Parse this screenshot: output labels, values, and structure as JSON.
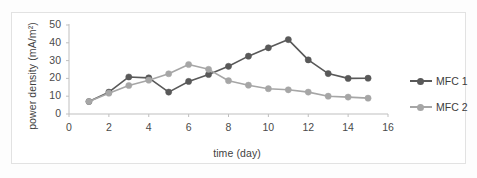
{
  "chart_data": {
    "type": "line",
    "title": "",
    "xlabel": "time (day)",
    "ylabel": "power density (mA/m²)",
    "x": [
      1,
      2,
      3,
      4,
      5,
      6,
      7,
      8,
      9,
      10,
      11,
      12,
      13,
      14,
      15
    ],
    "xlim": [
      0,
      16
    ],
    "ylim": [
      0,
      50
    ],
    "xticks": [
      "0",
      "2",
      "4",
      "6",
      "8",
      "10",
      "12",
      "14",
      "16"
    ],
    "xtick_values": [
      0,
      2,
      4,
      6,
      8,
      10,
      12,
      14,
      16
    ],
    "yticks": [
      "0",
      "10",
      "20",
      "30",
      "40",
      "50"
    ],
    "ytick_values": [
      0,
      10,
      20,
      30,
      40,
      50
    ],
    "grid": false,
    "legend_position": "right",
    "series": [
      {
        "name": "MFC 1",
        "color": "#595959",
        "marker": "circle",
        "values": [
          7.0,
          12.3,
          20.8,
          20.3,
          12.3,
          18.3,
          22.2,
          26.8,
          32.5,
          37.2,
          41.8,
          30.4,
          22.7,
          20.0,
          20.1
        ]
      },
      {
        "name": "MFC 2",
        "color": "#a6a6a6",
        "marker": "circle",
        "values": [
          7.0,
          11.7,
          16.0,
          19.0,
          22.6,
          27.8,
          25.1,
          18.7,
          16.2,
          14.2,
          13.6,
          12.3,
          10.0,
          9.5,
          8.9
        ]
      }
    ]
  },
  "legend": {
    "items": [
      {
        "label": "MFC 1",
        "color": "#595959"
      },
      {
        "label": "MFC 2",
        "color": "#a6a6a6"
      }
    ]
  },
  "axis_colors": {
    "axis_line": "#bfbfbf",
    "tick_text": "#4a4a4a",
    "frame": "#e2e2e2"
  }
}
